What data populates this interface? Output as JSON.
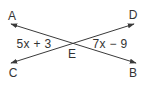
{
  "diagram": {
    "type": "intersecting-lines",
    "colors": {
      "line": "#3a3a3a",
      "text": "#333333",
      "background": "#ffffff"
    },
    "points": {
      "A": {
        "label": "A",
        "x": 12,
        "y": 16
      },
      "B": {
        "label": "B",
        "x": 133,
        "y": 73
      },
      "C": {
        "label": "C",
        "x": 13,
        "y": 73
      },
      "D": {
        "label": "D",
        "x": 133,
        "y": 15
      },
      "E": {
        "label": "E",
        "x": 72,
        "y": 54
      }
    },
    "lines": [
      {
        "name": "line-AB",
        "from": "A",
        "to": "B",
        "arrows": "both"
      },
      {
        "name": "line-CD",
        "from": "C",
        "to": "D",
        "arrows": "both"
      }
    ],
    "intersection": {
      "label": "E",
      "x": 71,
      "y": 43
    },
    "angles": {
      "left": {
        "expression": "5x + 3",
        "between": [
          "A",
          "C"
        ]
      },
      "right": {
        "expression": "7x − 9",
        "between": [
          "D",
          "B"
        ]
      }
    }
  }
}
